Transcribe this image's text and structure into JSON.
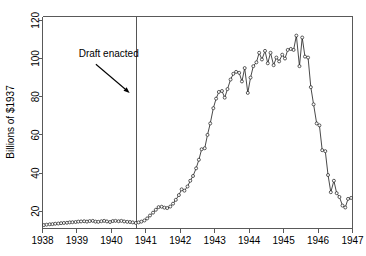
{
  "chart_data": {
    "type": "line",
    "title": "",
    "subtitle": "",
    "xlabel": "",
    "ylabel": "Billions of $1937",
    "xlim": [
      1938.0,
      1947.0
    ],
    "ylim": [
      11,
      122
    ],
    "yticks": [
      20,
      40,
      60,
      80,
      100,
      120
    ],
    "ytick_labels": [
      "20",
      "40",
      "60",
      "80",
      "100",
      "120"
    ],
    "xticks": [
      1938,
      1939,
      1940,
      1941,
      1942,
      1943,
      1944,
      1945,
      1946,
      1947
    ],
    "xtick_labels": [
      "1938",
      "1939",
      "1940",
      "1941",
      "1942",
      "1943",
      "1944",
      "1945",
      "1946",
      "1947"
    ],
    "grid": false,
    "legend": "none",
    "markers": "open-circle",
    "annotations": [
      {
        "text": "Draft enacted",
        "text_x": 1939.05,
        "text_y": 101,
        "arrow_from_x": 1939.55,
        "arrow_from_y": 97,
        "arrow_to_x": 1940.53,
        "arrow_to_y": 82
      }
    ],
    "vertical_lines": [
      {
        "x": 1940.7,
        "label": "Draft enacted"
      }
    ],
    "series": [
      {
        "name": "Real federal spending",
        "x": [
          1938.04,
          1938.12,
          1938.21,
          1938.29,
          1938.37,
          1938.46,
          1938.54,
          1938.62,
          1938.71,
          1938.79,
          1938.87,
          1938.96,
          1939.04,
          1939.12,
          1939.21,
          1939.29,
          1939.37,
          1939.46,
          1939.54,
          1939.62,
          1939.71,
          1939.79,
          1939.87,
          1939.96,
          1940.04,
          1940.12,
          1940.21,
          1940.29,
          1940.37,
          1940.46,
          1940.54,
          1940.62,
          1940.71,
          1940.79,
          1940.87,
          1940.96,
          1941.04,
          1941.12,
          1941.21,
          1941.29,
          1941.37,
          1941.46,
          1941.54,
          1941.62,
          1941.71,
          1941.79,
          1941.87,
          1941.96,
          1942.04,
          1942.12,
          1942.21,
          1942.29,
          1942.37,
          1942.46,
          1942.54,
          1942.62,
          1942.71,
          1942.79,
          1942.87,
          1942.96,
          1943.04,
          1943.12,
          1943.21,
          1943.29,
          1943.37,
          1943.46,
          1943.54,
          1943.62,
          1943.71,
          1943.79,
          1943.87,
          1943.96,
          1944.04,
          1944.12,
          1944.21,
          1944.29,
          1944.37,
          1944.46,
          1944.54,
          1944.62,
          1944.71,
          1944.79,
          1944.87,
          1944.96,
          1945.04,
          1945.12,
          1945.21,
          1945.29,
          1945.37,
          1945.46,
          1945.54,
          1945.62,
          1945.71,
          1945.79,
          1945.87,
          1945.96,
          1946.04,
          1946.12,
          1946.21,
          1946.29,
          1946.37,
          1946.46,
          1946.54,
          1946.62,
          1946.71,
          1946.79,
          1946.87,
          1946.96
        ],
        "y": [
          12.8,
          13.0,
          13.2,
          13.3,
          13.5,
          13.6,
          13.8,
          13.9,
          14.0,
          14.2,
          14.3,
          14.4,
          14.6,
          14.7,
          14.8,
          14.6,
          14.9,
          15.0,
          14.6,
          14.5,
          14.8,
          15.0,
          14.7,
          14.4,
          14.9,
          15.0,
          14.8,
          15.0,
          14.7,
          14.5,
          14.4,
          14.2,
          13.9,
          14.2,
          14.6,
          15.2,
          16.3,
          17.8,
          19.3,
          20.8,
          22.2,
          22.4,
          21.9,
          21.7,
          22.5,
          24.0,
          26.0,
          28.5,
          31.5,
          30.8,
          33.0,
          36.0,
          38.5,
          42.5,
          47.0,
          52.5,
          53.0,
          60.0,
          66.0,
          74.0,
          79.0,
          82.5,
          83.0,
          79.5,
          84.0,
          89.0,
          92.0,
          93.0,
          92.5,
          88.0,
          95.0,
          82.0,
          90.0,
          96.0,
          98.0,
          103.0,
          99.5,
          104.0,
          97.5,
          103.0,
          96.5,
          100.5,
          98.5,
          102.0,
          100.0,
          104.5,
          105.0,
          104.5,
          112.0,
          96.0,
          111.0,
          101.0,
          100.5,
          85.0,
          76.0,
          66.0,
          65.0,
          52.0,
          51.5,
          39.0,
          30.0,
          36.0,
          29.5,
          27.5,
          23.0,
          22.0,
          26.5,
          27.0
        ]
      }
    ]
  }
}
